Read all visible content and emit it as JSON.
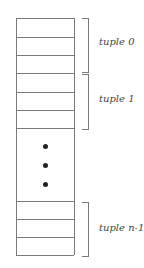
{
  "diagram": {
    "type": "record-layout",
    "groups": [
      {
        "label": "tuple 0",
        "rows": 3
      },
      {
        "label": "tuple 1",
        "rows": 3
      },
      {
        "label": "tuple n-1",
        "rows": 3
      }
    ],
    "ellipsis": "vertical dots",
    "colors": {
      "line": "#7a7a7a",
      "dot": "#222222",
      "text": "#444444"
    }
  }
}
